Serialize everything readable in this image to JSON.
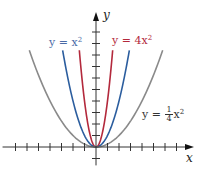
{
  "chart_data": {
    "type": "line",
    "title": "",
    "xlabel": "x",
    "ylabel": "y",
    "x_ticks": [
      -7,
      -6,
      -5,
      -4,
      -3,
      -2,
      -1,
      1,
      2,
      3,
      4,
      5,
      6,
      7
    ],
    "y_ticks": [
      -1,
      1,
      2,
      3,
      4,
      5,
      6,
      7,
      8,
      9,
      10
    ],
    "xlim": [
      -8.3,
      8.3
    ],
    "ylim": [
      -1.6,
      11.5
    ],
    "grid": false,
    "legend": "inline labels",
    "series": [
      {
        "name": "y = 4x²",
        "equation": "4x^2",
        "coef": 4,
        "color": "#b3293c",
        "x_range": [
          -1.45,
          1.45
        ]
      },
      {
        "name": "y = x²",
        "equation": "x^2",
        "coef": 1,
        "color": "#2b5d9e",
        "x_range": [
          -2.9,
          2.9
        ]
      },
      {
        "name": "y = ¼x²",
        "equation": "(1/4)x^2",
        "coef": 0.25,
        "color": "#8a8a8a",
        "x_range": [
          -5.8,
          5.8
        ]
      }
    ]
  },
  "labels": {
    "x_axis": "x",
    "y_axis": "y",
    "eq_x2": {
      "prefix": "y = x",
      "exp": "2",
      "color": "#4a6aa6"
    },
    "eq_4x2": {
      "prefix": "y = 4x",
      "exp": "2",
      "color": "#b3293c"
    },
    "eq_quarter": {
      "prefix": "y = ",
      "num": "1",
      "den": "4",
      "var": "x",
      "exp": "2",
      "color": "#333333"
    }
  },
  "layout": {
    "origin": [
      96,
      147
    ],
    "unit_px": 11.5,
    "axis_color": "#333333"
  }
}
